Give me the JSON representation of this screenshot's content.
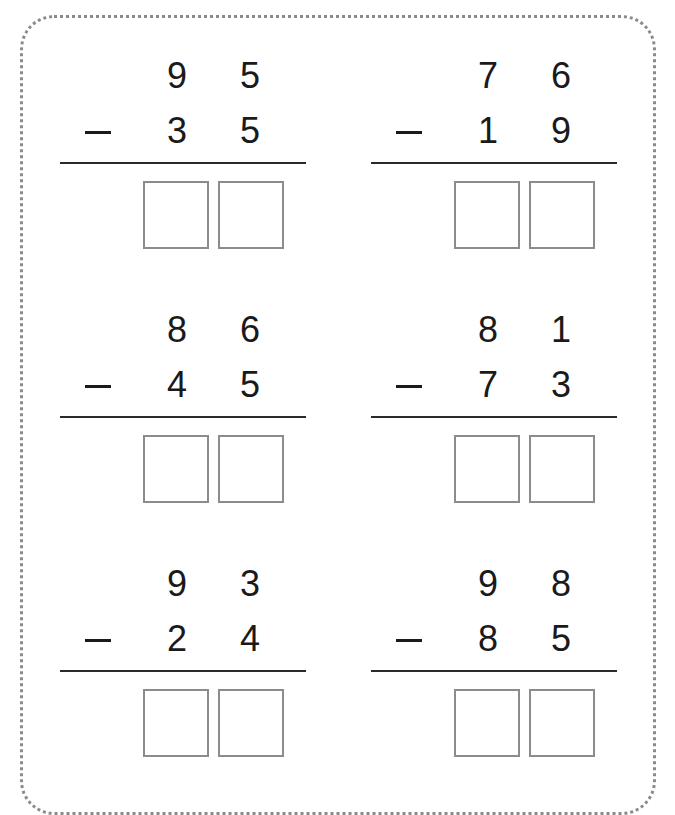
{
  "worksheet": {
    "operation": "subtraction",
    "operator_symbol": "−",
    "problems": [
      {
        "minuend": {
          "tens": "9",
          "ones": "5"
        },
        "subtrahend": {
          "tens": "3",
          "ones": "5"
        },
        "answer": {
          "tens": "",
          "ones": ""
        }
      },
      {
        "minuend": {
          "tens": "7",
          "ones": "6"
        },
        "subtrahend": {
          "tens": "1",
          "ones": "9"
        },
        "answer": {
          "tens": "",
          "ones": ""
        }
      },
      {
        "minuend": {
          "tens": "8",
          "ones": "6"
        },
        "subtrahend": {
          "tens": "4",
          "ones": "5"
        },
        "answer": {
          "tens": "",
          "ones": ""
        }
      },
      {
        "minuend": {
          "tens": "8",
          "ones": "1"
        },
        "subtrahend": {
          "tens": "7",
          "ones": "3"
        },
        "answer": {
          "tens": "",
          "ones": ""
        }
      },
      {
        "minuend": {
          "tens": "9",
          "ones": "3"
        },
        "subtrahend": {
          "tens": "2",
          "ones": "4"
        },
        "answer": {
          "tens": "",
          "ones": ""
        }
      },
      {
        "minuend": {
          "tens": "9",
          "ones": "8"
        },
        "subtrahend": {
          "tens": "8",
          "ones": "5"
        },
        "answer": {
          "tens": "",
          "ones": ""
        }
      }
    ]
  },
  "colors": {
    "text": "#1a1a1a",
    "border_dots": "#8a8a8a",
    "answer_box_border": "#8c8c8c"
  }
}
